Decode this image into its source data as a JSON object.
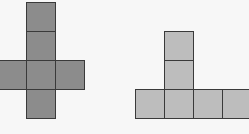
{
  "figures": [
    {
      "name": "cross-net",
      "fill": "#8c8c8c",
      "cells": [
        {
          "x": 26,
          "y": 2
        },
        {
          "x": 26,
          "y": 31
        },
        {
          "x": -3,
          "y": 60
        },
        {
          "x": 26,
          "y": 60
        },
        {
          "x": 55,
          "y": 60
        },
        {
          "x": 26,
          "y": 89
        }
      ]
    },
    {
      "name": "t-net",
      "fill": "#bdbdbd",
      "cells": [
        {
          "x": 164,
          "y": 31
        },
        {
          "x": 164,
          "y": 60
        },
        {
          "x": 135,
          "y": 89
        },
        {
          "x": 164,
          "y": 89
        },
        {
          "x": 193,
          "y": 89
        },
        {
          "x": 222,
          "y": 89
        }
      ]
    }
  ]
}
